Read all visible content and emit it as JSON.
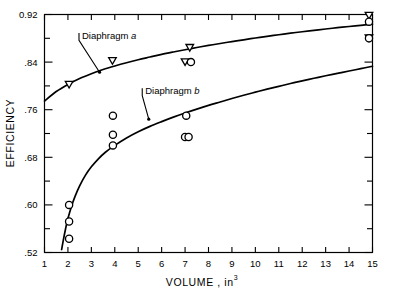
{
  "chart_data": {
    "type": "scatter",
    "title": "",
    "xlabel": "VOLUME , in3",
    "xlabel_main": "VOLUME ,  in",
    "xlabel_sup": "3",
    "ylabel": "EFFICIENCY",
    "xlim": [
      1,
      15
    ],
    "ylim": [
      0.52,
      0.92
    ],
    "grid": false,
    "legend_position": "inline-annotations",
    "xticks": [
      1,
      2,
      3,
      4,
      5,
      6,
      7,
      8,
      9,
      10,
      11,
      12,
      13,
      14,
      15
    ],
    "xticklabels": [
      "1",
      "2",
      "3",
      "4",
      "5",
      "6",
      "7",
      "8",
      "9",
      "10",
      "11",
      "12",
      "13",
      "14",
      "15"
    ],
    "yticks": [
      0.52,
      0.56,
      0.6,
      0.64,
      0.68,
      0.72,
      0.76,
      0.8,
      0.84,
      0.88,
      0.92
    ],
    "ytick_major": [
      0.52,
      0.6,
      0.68,
      0.76,
      0.84,
      0.92
    ],
    "yticklabels": [
      ".52",
      ".60",
      ".68",
      ".76",
      ".84",
      "0.92"
    ],
    "annotations": [
      {
        "text": "Diaphragm a",
        "x": 2.6,
        "y": 0.879,
        "target_x": 3.35,
        "target_y": 0.823
      },
      {
        "text": "Diaphragm b",
        "x": 5.3,
        "y": 0.786,
        "target_x": 5.45,
        "target_y": 0.744
      }
    ],
    "series": [
      {
        "name": "Diaphragm a",
        "marker": "triangle-down",
        "curve_points": [
          [
            1.0,
            0.7745
          ],
          [
            1.5,
            0.7905
          ],
          [
            2.0,
            0.8025
          ],
          [
            2.5,
            0.8125
          ],
          [
            3.0,
            0.8205
          ],
          [
            3.5,
            0.8275
          ],
          [
            4.0,
            0.8335
          ],
          [
            4.5,
            0.839
          ],
          [
            5.0,
            0.844
          ],
          [
            5.5,
            0.8485
          ],
          [
            6.0,
            0.853
          ],
          [
            6.5,
            0.857
          ],
          [
            7.0,
            0.8608
          ],
          [
            7.5,
            0.8645
          ],
          [
            8.0,
            0.868
          ],
          [
            8.5,
            0.8713
          ],
          [
            9.0,
            0.8745
          ],
          [
            9.5,
            0.8775
          ],
          [
            10.0,
            0.8805
          ],
          [
            10.5,
            0.8833
          ],
          [
            11.0,
            0.886
          ],
          [
            11.5,
            0.8886
          ],
          [
            12.0,
            0.891
          ],
          [
            12.5,
            0.8934
          ],
          [
            13.0,
            0.8956
          ],
          [
            13.5,
            0.8978
          ],
          [
            14.0,
            0.8998
          ],
          [
            14.5,
            0.9018
          ],
          [
            15.0,
            0.9037
          ]
        ],
        "points": [
          [
            2.05,
            0.802
          ],
          [
            3.9,
            0.842
          ],
          [
            7.2,
            0.864
          ],
          [
            7.0,
            0.84
          ],
          [
            14.85,
            0.918
          ],
          [
            14.85,
            0.88
          ]
        ]
      },
      {
        "name": "Diaphragm b",
        "marker": "circle",
        "curve_points": [
          [
            1.73,
            0.525
          ],
          [
            1.8,
            0.54
          ],
          [
            1.9,
            0.56
          ],
          [
            2.0,
            0.577
          ],
          [
            2.15,
            0.5975
          ],
          [
            2.3,
            0.614
          ],
          [
            2.5,
            0.632
          ],
          [
            2.75,
            0.65
          ],
          [
            3.0,
            0.664
          ],
          [
            3.3,
            0.6775
          ],
          [
            3.6,
            0.6885
          ],
          [
            4.0,
            0.7
          ],
          [
            4.5,
            0.7125
          ],
          [
            5.0,
            0.723
          ],
          [
            5.5,
            0.732
          ],
          [
            6.0,
            0.74
          ],
          [
            6.5,
            0.7475
          ],
          [
            7.0,
            0.7545
          ],
          [
            7.5,
            0.761
          ],
          [
            8.0,
            0.7672
          ],
          [
            8.5,
            0.773
          ],
          [
            9.0,
            0.7788
          ],
          [
            9.5,
            0.7843
          ],
          [
            10.0,
            0.7895
          ],
          [
            10.5,
            0.7945
          ],
          [
            11.0,
            0.7993
          ],
          [
            11.5,
            0.804
          ],
          [
            12.0,
            0.8085
          ],
          [
            12.5,
            0.8128
          ],
          [
            13.0,
            0.817
          ],
          [
            13.5,
            0.821
          ],
          [
            14.0,
            0.825
          ],
          [
            14.5,
            0.829
          ],
          [
            15.0,
            0.833
          ]
        ],
        "points": [
          [
            2.05,
            0.6
          ],
          [
            2.05,
            0.572
          ],
          [
            2.05,
            0.543
          ],
          [
            3.92,
            0.75
          ],
          [
            3.92,
            0.718
          ],
          [
            3.92,
            0.7
          ],
          [
            7.25,
            0.84
          ],
          [
            7.05,
            0.75
          ],
          [
            7.0,
            0.714
          ],
          [
            7.15,
            0.714
          ],
          [
            14.85,
            0.908
          ],
          [
            14.85,
            0.88
          ]
        ]
      }
    ]
  }
}
